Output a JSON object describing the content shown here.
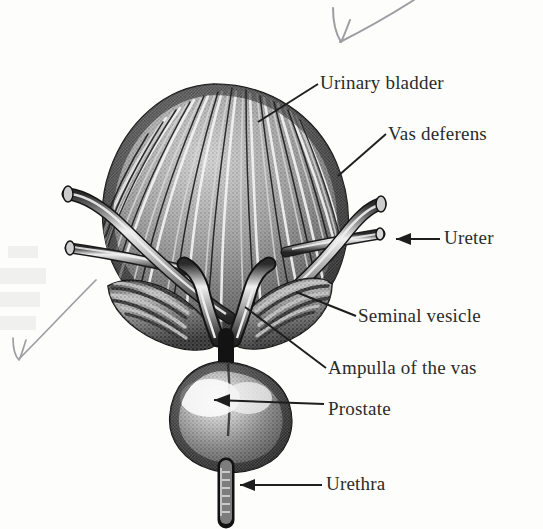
{
  "figure": {
    "kind": "anatomical-engraving",
    "background_color": "#fdfdfc",
    "ink_color": "#2b2b2b"
  },
  "labels": [
    {
      "id": "urinary-bladder",
      "text": "Urinary bladder",
      "leader": "line",
      "x": 320,
      "y": 72
    },
    {
      "id": "vas-deferens",
      "text": "Vas deferens",
      "leader": "line",
      "x": 388,
      "y": 123
    },
    {
      "id": "ureter",
      "text": "Ureter",
      "leader": "arrow",
      "x": 444,
      "y": 227
    },
    {
      "id": "seminal-vesicle",
      "text": "Seminal vesicle",
      "leader": "line",
      "x": 358,
      "y": 305
    },
    {
      "id": "ampulla-of-the-vas",
      "text": "Ampulla of the vas",
      "leader": "line",
      "x": 328,
      "y": 357
    },
    {
      "id": "prostate",
      "text": "Prostate",
      "leader": "arrow",
      "x": 328,
      "y": 398
    },
    {
      "id": "urethra",
      "text": "Urethra",
      "leader": "arrow",
      "x": 326,
      "y": 473
    }
  ],
  "annotations": [
    {
      "id": "pencil-arrow-top",
      "kind": "hand-drawn-arrow",
      "direction": "down-left",
      "color": "#8d8d93"
    },
    {
      "id": "pencil-arrow-left",
      "kind": "hand-drawn-arrow",
      "direction": "down-left",
      "color": "#8d8d93"
    }
  ],
  "structures": [
    {
      "id": "bladder",
      "name": "Urinary bladder"
    },
    {
      "id": "ureter-left",
      "name": "Ureter (left)"
    },
    {
      "id": "ureter-right",
      "name": "Ureter (right)"
    },
    {
      "id": "vas-deferens-left",
      "name": "Vas deferens (left)"
    },
    {
      "id": "vas-deferens-right",
      "name": "Vas deferens (right)"
    },
    {
      "id": "seminal-vesicle-left",
      "name": "Seminal vesicle (left)"
    },
    {
      "id": "seminal-vesicle-right",
      "name": "Seminal vesicle (right)"
    },
    {
      "id": "ampulla-left",
      "name": "Ampulla of the vas (left)"
    },
    {
      "id": "ampulla-right",
      "name": "Ampulla of the vas (right)"
    },
    {
      "id": "prostate",
      "name": "Prostate"
    },
    {
      "id": "urethra",
      "name": "Urethra"
    }
  ]
}
